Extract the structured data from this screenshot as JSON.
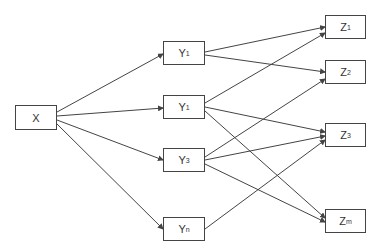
{
  "nodes": {
    "x": {
      "label": "X",
      "sub": ""
    },
    "y1": {
      "label": "Y",
      "sub": "1"
    },
    "y2": {
      "label": "Y",
      "sub": "1"
    },
    "y3": {
      "label": "Y",
      "sub": "3"
    },
    "yn": {
      "label": "Y",
      "sub": "n"
    },
    "z1": {
      "label": "Z",
      "sub": "1"
    },
    "z2": {
      "label": "Z",
      "sub": "2"
    },
    "z3": {
      "label": "Z",
      "sub": "3"
    },
    "zm": {
      "label": "Z",
      "sub": "m"
    }
  },
  "edges": [
    [
      "x",
      "y1"
    ],
    [
      "x",
      "y2"
    ],
    [
      "x",
      "y3"
    ],
    [
      "x",
      "yn"
    ],
    [
      "y1",
      "z1"
    ],
    [
      "y1",
      "z2"
    ],
    [
      "y2",
      "z1"
    ],
    [
      "y2",
      "z3"
    ],
    [
      "y2",
      "zm"
    ],
    [
      "y3",
      "z2"
    ],
    [
      "y3",
      "z3"
    ],
    [
      "y3",
      "zm"
    ],
    [
      "yn",
      "z3"
    ]
  ]
}
